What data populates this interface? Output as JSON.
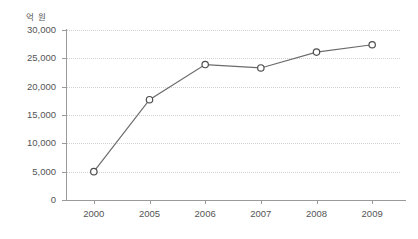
{
  "chart_data": {
    "type": "line",
    "title": "",
    "xlabel": "",
    "ylabel": "",
    "unit_label": "억 원",
    "categories": [
      "2000",
      "2005",
      "2006",
      "2007",
      "2008",
      "2009"
    ],
    "values": [
      5000,
      17700,
      23900,
      23300,
      26100,
      27400
    ],
    "series": [
      {
        "name": "",
        "values": [
          5000,
          17700,
          23900,
          23300,
          26100,
          27400
        ]
      }
    ],
    "ylim": [
      0,
      30000
    ],
    "yticks": [
      0,
      5000,
      10000,
      15000,
      20000,
      25000,
      30000
    ],
    "ytick_labels": [
      "0",
      "5,000",
      "10,000",
      "15,000",
      "20,000",
      "25,000",
      "30,000"
    ],
    "grid": "horizontal-dotted",
    "legend": "none",
    "marker": "open-circle",
    "colors": {
      "line": "#6b6b6b",
      "marker_stroke": "#4d4d4d",
      "marker_fill": "#ffffff",
      "gridline": "#d2d2d2",
      "axis": "#9a9a9a",
      "text": "#555555",
      "background": "#ffffff"
    }
  }
}
